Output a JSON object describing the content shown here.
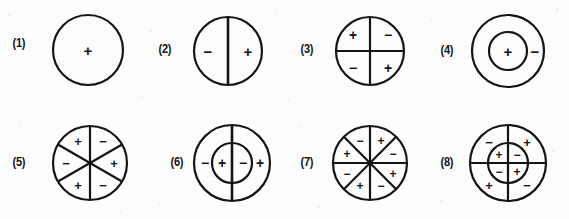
{
  "plate": {
    "background_color": "#fdfdfd",
    "ink_color": "#141414",
    "width": 569,
    "height": 219,
    "sign_plus": "+",
    "sign_minus": "−"
  },
  "figures": [
    {
      "id": "figure-1",
      "label": "(1)",
      "label_x": 12,
      "label_y": 44,
      "center_x": 88,
      "center_y": 50,
      "outer_radius": 35,
      "inner_radius": 0,
      "sector_count": 1,
      "sector_start_deg": 0,
      "divider_type": "none",
      "description": "single circle with one plus at center",
      "signs": [
        {
          "text": "+",
          "x": 88,
          "y": 50,
          "size": 15
        }
      ]
    },
    {
      "id": "figure-2",
      "label": "(2)",
      "label_x": 158,
      "label_y": 50,
      "center_x": 228,
      "center_y": 51,
      "outer_radius": 34,
      "inner_radius": 0,
      "sector_count": 2,
      "sector_start_deg": 90,
      "divider_type": "vertical",
      "description": "circle split by a vertical diameter, minus left, plus right",
      "signs": [
        {
          "text": "−",
          "x": 208,
          "y": 51,
          "size": 15
        },
        {
          "text": "+",
          "x": 248,
          "y": 51,
          "size": 15
        }
      ]
    },
    {
      "id": "figure-3",
      "label": "(3)",
      "label_x": 300,
      "label_y": 50,
      "center_x": 370,
      "center_y": 51,
      "outer_radius": 34,
      "inner_radius": 0,
      "sector_count": 4,
      "sector_start_deg": 90,
      "divider_type": "cross",
      "description": "circle split into four quadrants, plus minus over minus plus",
      "signs": [
        {
          "text": "+",
          "x": 353,
          "y": 35,
          "size": 14
        },
        {
          "text": "−",
          "x": 388,
          "y": 35,
          "size": 14
        },
        {
          "text": "−",
          "x": 353,
          "y": 68,
          "size": 14
        },
        {
          "text": "+",
          "x": 388,
          "y": 68,
          "size": 14
        }
      ]
    },
    {
      "id": "figure-4",
      "label": "(4)",
      "label_x": 440,
      "label_y": 51,
      "center_x": 508,
      "center_y": 51,
      "outer_radius": 36,
      "inner_radius": 19,
      "sector_count": 1,
      "sector_start_deg": 0,
      "divider_type": "none",
      "description": "concentric circles, plus in the core, minus in the ring",
      "signs": [
        {
          "text": "+",
          "x": 508,
          "y": 51,
          "size": 15
        },
        {
          "text": "−",
          "x": 535,
          "y": 51,
          "size": 15
        }
      ]
    },
    {
      "id": "figure-5",
      "label": "(5)",
      "label_x": 12,
      "label_y": 163,
      "center_x": 90,
      "center_y": 163,
      "outer_radius": 37,
      "inner_radius": 0,
      "sector_count": 6,
      "sector_start_deg": 90,
      "divider_type": "spokes",
      "description": "circle cut into six sectors with alternating plus and minus",
      "signs": [
        {
          "text": "+",
          "x": 78,
          "y": 141,
          "size": 13
        },
        {
          "text": "−",
          "x": 103,
          "y": 141,
          "size": 13
        },
        {
          "text": "+",
          "x": 114,
          "y": 163,
          "size": 13
        },
        {
          "text": "−",
          "x": 103,
          "y": 185,
          "size": 13
        },
        {
          "text": "+",
          "x": 78,
          "y": 185,
          "size": 13
        },
        {
          "text": "−",
          "x": 66,
          "y": 163,
          "size": 13
        }
      ]
    },
    {
      "id": "figure-6",
      "label": "(6)",
      "label_x": 170,
      "label_y": 163,
      "center_x": 232,
      "center_y": 163,
      "outer_radius": 38,
      "inner_radius": 20,
      "sector_count": 2,
      "sector_start_deg": 90,
      "divider_type": "vertical",
      "description": "concentric circles with a vertical diameter, minus plus minus plus left to right",
      "signs": [
        {
          "text": "−",
          "x": 205,
          "y": 163,
          "size": 14
        },
        {
          "text": "+",
          "x": 222,
          "y": 163,
          "size": 14
        },
        {
          "text": "−",
          "x": 243,
          "y": 163,
          "size": 14
        },
        {
          "text": "+",
          "x": 260,
          "y": 163,
          "size": 14
        }
      ]
    },
    {
      "id": "figure-7",
      "label": "(7)",
      "label_x": 300,
      "label_y": 163,
      "center_x": 370,
      "center_y": 163,
      "outer_radius": 37,
      "inner_radius": 0,
      "sector_count": 8,
      "sector_start_deg": 90,
      "divider_type": "spokes",
      "description": "circle cut into eight sectors with alternating plus and minus",
      "signs": [
        {
          "text": "−",
          "x": 360,
          "y": 141,
          "size": 12
        },
        {
          "text": "+",
          "x": 381,
          "y": 141,
          "size": 12
        },
        {
          "text": "−",
          "x": 393,
          "y": 154,
          "size": 12
        },
        {
          "text": "+",
          "x": 393,
          "y": 174,
          "size": 12
        },
        {
          "text": "−",
          "x": 381,
          "y": 186,
          "size": 12
        },
        {
          "text": "+",
          "x": 360,
          "y": 186,
          "size": 12
        },
        {
          "text": "−",
          "x": 347,
          "y": 174,
          "size": 12
        },
        {
          "text": "+",
          "x": 347,
          "y": 154,
          "size": 12
        }
      ]
    },
    {
      "id": "figure-8",
      "label": "(8)",
      "label_x": 440,
      "label_y": 163,
      "center_x": 508,
      "center_y": 163,
      "outer_radius": 38,
      "inner_radius": 20,
      "sector_count": 4,
      "sector_start_deg": 90,
      "divider_type": "cross",
      "description": "concentric circles with quadrant lines, ring signs minus plus plus minus and core signs plus minus minus plus",
      "signs": [
        {
          "text": "−",
          "x": 489,
          "y": 142,
          "size": 13
        },
        {
          "text": "+",
          "x": 527,
          "y": 142,
          "size": 13
        },
        {
          "text": "+",
          "x": 489,
          "y": 185,
          "size": 13
        },
        {
          "text": "−",
          "x": 527,
          "y": 185,
          "size": 13
        },
        {
          "text": "+",
          "x": 499,
          "y": 155,
          "size": 12
        },
        {
          "text": "−",
          "x": 517,
          "y": 155,
          "size": 12
        },
        {
          "text": "−",
          "x": 499,
          "y": 172,
          "size": 12
        },
        {
          "text": "+",
          "x": 517,
          "y": 172,
          "size": 12
        }
      ]
    }
  ],
  "speckles": [
    {
      "x": 8,
      "y": 14,
      "size": 2
    },
    {
      "x": 141,
      "y": 96,
      "size": 2
    },
    {
      "x": 150,
      "y": 30,
      "size": 2
    },
    {
      "x": 276,
      "y": 12,
      "size": 2
    },
    {
      "x": 288,
      "y": 100,
      "size": 2
    },
    {
      "x": 430,
      "y": 20,
      "size": 2
    },
    {
      "x": 556,
      "y": 8,
      "size": 3
    },
    {
      "x": 20,
      "y": 122,
      "size": 2
    },
    {
      "x": 158,
      "y": 204,
      "size": 2
    },
    {
      "x": 300,
      "y": 126,
      "size": 2
    },
    {
      "x": 318,
      "y": 206,
      "size": 2
    },
    {
      "x": 440,
      "y": 200,
      "size": 2
    },
    {
      "x": 552,
      "y": 150,
      "size": 2
    },
    {
      "x": 120,
      "y": 210,
      "size": 2
    }
  ]
}
